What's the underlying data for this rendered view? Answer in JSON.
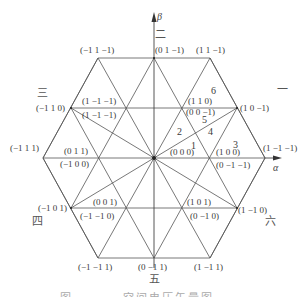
{
  "diagram": {
    "type": "space-vector-hexagon",
    "axes": {
      "alpha": "α",
      "beta": "β"
    },
    "sectors": [
      "一",
      "二",
      "三",
      "四",
      "五",
      "六"
    ],
    "regions": [
      "1",
      "2",
      "3",
      "4",
      "5",
      "6"
    ],
    "vertex_labels": {
      "top_left": "(−1 1 −1)",
      "top_mid": "(0 1 −1)",
      "top_right": "(1 1 −1)",
      "upper_left_mid": "(−1 1 0)",
      "upper_left_inner_a": "(1 −1 −1)",
      "upper_left_inner_b": "(1 −1 −1)",
      "upper_right_inner_a": "(1 1 0)",
      "upper_right_inner_b": "(0 0 −1)",
      "upper_right_mid": "(1 0 −1)",
      "left": "(−1 1 1)",
      "left_inner_a": "(0 1 1)",
      "left_inner_b": "(−1 0 0)",
      "center": "(0 0 0)",
      "right_inner_a": "(1 0 0)",
      "right_inner_b": "(0 −1 −1)",
      "right": "(1 −1 −1)",
      "lower_left_mid": "(−1 0 1)",
      "lower_left_inner_a": "(0 0 1)",
      "lower_left_inner_b": "(−1 −1 0)",
      "lower_right_inner_a": "(1 0 1)",
      "lower_right_inner_b": "(0 −1 0)",
      "lower_right_mid": "(1 −1 0)",
      "bottom_left": "(−1 −1 1)",
      "bottom_mid": "(0 −1 1)",
      "bottom_right": "(1 −1 1)"
    },
    "caption": "图 ……… 空间电压矢量图"
  }
}
